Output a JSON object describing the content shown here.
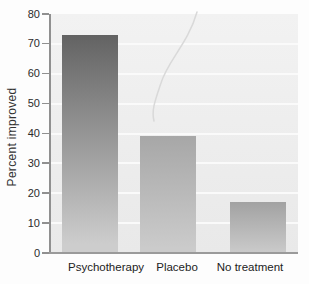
{
  "chart_data": {
    "type": "bar",
    "categories": [
      "Psychotherapy",
      "Placebo",
      "No treatment"
    ],
    "values": [
      73,
      39,
      17
    ],
    "title": "",
    "xlabel": "",
    "ylabel": "Percent improved",
    "ylim": [
      0,
      80
    ],
    "yticks": [
      0,
      10,
      20,
      30,
      40,
      50,
      60,
      70,
      80
    ],
    "grid": true,
    "legend_position": "none",
    "bar_styles": [
      {
        "category": "Psychotherapy",
        "color_top": "#636363",
        "color_bottom": "#cdcdcd"
      },
      {
        "category": "Placebo",
        "color_top": "#a7a7a7",
        "color_bottom": "#cbcbcb"
      },
      {
        "category": "No treatment",
        "color_top": "#a2a2a2",
        "color_bottom": "#c9c9c9"
      }
    ],
    "colors": {
      "plot_background_top": "#f2f2f2",
      "plot_background_bottom": "#e9e9e9",
      "gridline": "#fafafa",
      "axis": "#909090",
      "baseline": "#9a9a9a",
      "tick_text": "#2b2b2b",
      "label_text": "#222222",
      "page_background": "#fdfdfd",
      "scan_crease": "#d9d9d9"
    }
  }
}
